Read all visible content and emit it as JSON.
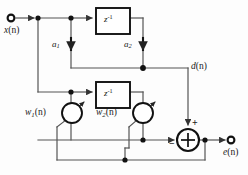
{
  "diagram": {
    "canvas": {
      "width": 248,
      "height": 175
    },
    "style": {
      "line_color": "#555555",
      "ink_color": "#111111",
      "background": "#fdfdfd",
      "line_width": 1.2
    },
    "ports": [
      {
        "id": "input",
        "label": "x(n)",
        "base": "x",
        "arg": "(n)",
        "x": 12,
        "y": 18
      },
      {
        "id": "output",
        "label": "e(n)",
        "base": "e",
        "arg": "(n)",
        "x": 232,
        "y": 140
      }
    ],
    "blocks": [
      {
        "id": "delay-top",
        "label": "z-1",
        "base": "z",
        "exp": "-1",
        "x": 96,
        "y": 8,
        "w": 34,
        "h": 26
      },
      {
        "id": "delay-bottom",
        "label": "z-1",
        "base": "z",
        "exp": "-1",
        "x": 96,
        "y": 82,
        "w": 34,
        "h": 26
      }
    ],
    "gains": [
      {
        "id": "coef-a1",
        "label": "a1",
        "base": "a",
        "sub": "1",
        "x": 50,
        "y": 44
      },
      {
        "id": "coef-a2",
        "label": "a2",
        "base": "a",
        "sub": "2",
        "x": 126,
        "y": 44
      }
    ],
    "weights": [
      {
        "id": "weight-w1",
        "label": "w1(n)",
        "base": "w",
        "sub": "1",
        "arg": "(n)",
        "cx": 72,
        "cy": 113,
        "r": 10
      },
      {
        "id": "weight-w2",
        "label": "w2(n)",
        "base": "w",
        "sub": "2",
        "arg": "(n)",
        "cx": 143,
        "cy": 113,
        "r": 10
      }
    ],
    "summer": {
      "id": "summing-junction",
      "cx": 188,
      "cy": 140,
      "r": 11,
      "plus": "+",
      "minus": "−",
      "plus_pos": {
        "x": 194,
        "y": 122
      },
      "minus_pos": {
        "x": 170,
        "y": 140
      }
    },
    "signals": [
      {
        "id": "desired",
        "label": "d(n)",
        "base": "d",
        "arg": "(n)",
        "x": 193,
        "y": 68
      }
    ],
    "nodes": [
      {
        "id": "node-x-tap1",
        "x": 38,
        "y": 18
      },
      {
        "id": "node-x-tap2",
        "x": 71,
        "y": 18
      },
      {
        "id": "node-a2-merge",
        "x": 143,
        "y": 68
      },
      {
        "id": "node-w1-tap",
        "x": 71,
        "y": 92
      },
      {
        "id": "node-sum-in",
        "x": 143,
        "y": 140
      },
      {
        "id": "node-e-tap",
        "x": 205,
        "y": 140
      },
      {
        "id": "node-feedback",
        "x": 125,
        "y": 160
      }
    ],
    "wires_description": [
      "x(n) input to tap line across top",
      "top tap 1 down through a1 to summing line at y=68",
      "top tap 2 through z-1 delay then down through a2 to merge node",
      "merge node right to d(n) then down to summing junction plus input",
      "x branch down to lower filter tap line at y=92",
      "lower tap through w1(n) multiplier down to error summing line",
      "lower tap through z-1 delay then w2(n) multiplier down to error line",
      "error line into summing junction minus input",
      "summing junction to e(n) output with feedback tap down to both weights"
    ]
  }
}
